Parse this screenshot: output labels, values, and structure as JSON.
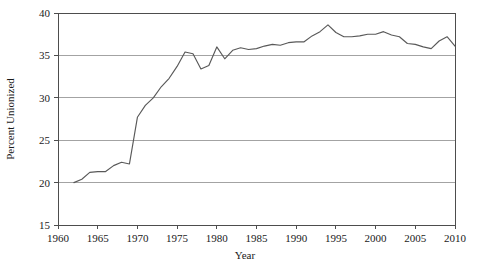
{
  "chart_data": {
    "type": "line",
    "title": "",
    "xlabel": "Year",
    "ylabel": "Percent Unionized",
    "xlim": [
      1960,
      2010
    ],
    "ylim": [
      15,
      40
    ],
    "xticks": [
      1960,
      1965,
      1970,
      1975,
      1980,
      1985,
      1990,
      1995,
      2000,
      2005,
      2010
    ],
    "yticks": [
      15,
      20,
      25,
      30,
      35,
      40
    ],
    "grid": "horizontal",
    "legend": "none",
    "line_color": "#595959",
    "grid_color": "#8c8c8c",
    "axis_color": "#4d4d4d",
    "series": [
      {
        "name": "Percent Unionized",
        "x": [
          1962,
          1963,
          1964,
          1965,
          1966,
          1967,
          1968,
          1969,
          1970,
          1971,
          1972,
          1973,
          1974,
          1975,
          1976,
          1977,
          1978,
          1979,
          1980,
          1981,
          1982,
          1983,
          1984,
          1985,
          1986,
          1987,
          1988,
          1989,
          1990,
          1991,
          1992,
          1993,
          1994,
          1995,
          1996,
          1997,
          1998,
          1999,
          2000,
          2001,
          2002,
          2003,
          2004,
          2005,
          2006,
          2007,
          2008,
          2009,
          2010
        ],
        "values": [
          20.0,
          20.4,
          21.2,
          21.3,
          21.3,
          22.0,
          22.4,
          22.2,
          27.7,
          29.1,
          30.0,
          31.3,
          32.3,
          33.7,
          35.4,
          35.2,
          33.4,
          33.8,
          36.0,
          34.6,
          35.6,
          35.9,
          35.7,
          35.8,
          36.1,
          36.3,
          36.2,
          36.5,
          36.6,
          36.6,
          37.3,
          37.8,
          38.6,
          37.7,
          37.2,
          37.2,
          37.3,
          37.5,
          37.5,
          37.8,
          37.4,
          37.2,
          36.4,
          36.3,
          36.0,
          35.8,
          36.7,
          37.2,
          36.1
        ]
      }
    ]
  },
  "plot_geometry": {
    "left": 58,
    "right": 455,
    "top": 13,
    "bottom": 225
  }
}
